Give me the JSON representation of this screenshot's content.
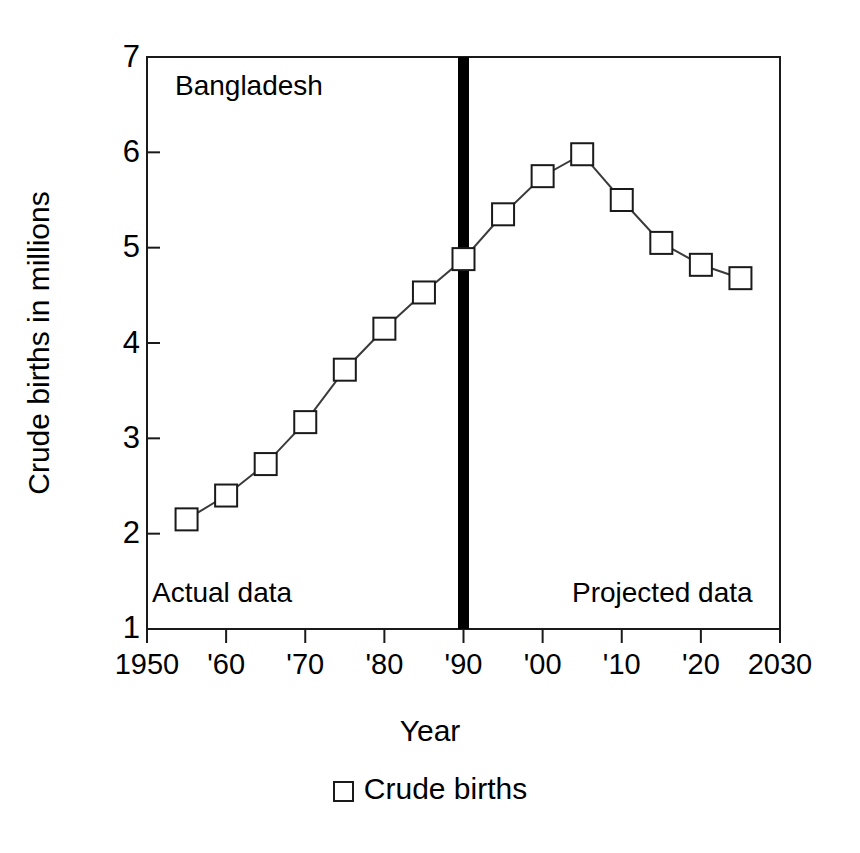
{
  "chart_data": {
    "type": "line",
    "title": "",
    "region_label": "Bangladesh",
    "xlabel": "Year",
    "ylabel": "Crude births in millions",
    "xlim": [
      1950,
      2030
    ],
    "ylim": [
      1,
      7
    ],
    "grid": false,
    "x": [
      1955,
      1960,
      1965,
      1970,
      1975,
      1980,
      1985,
      1990,
      1995,
      2000,
      2005,
      2010,
      2015,
      2020,
      2025
    ],
    "series": [
      {
        "name": "Crude births",
        "marker": "open-square",
        "values": [
          2.15,
          2.4,
          2.73,
          3.17,
          3.72,
          4.15,
          4.53,
          4.88,
          5.35,
          5.75,
          5.98,
          5.5,
          5.05,
          4.82,
          4.68
        ]
      }
    ],
    "y_ticks": [
      1,
      2,
      3,
      4,
      5,
      6,
      7
    ],
    "y_tick_labels": [
      "1",
      "2",
      "3",
      "4",
      "5",
      "6",
      "7"
    ],
    "x_ticks": [
      1950,
      1960,
      1970,
      1980,
      1990,
      2000,
      2010,
      2020,
      2030
    ],
    "x_tick_labels": [
      "1950",
      "'60",
      "'70",
      "'80",
      "'90",
      "'00",
      "'10",
      "'20",
      "2030"
    ],
    "annotations": [
      {
        "name": "actual-data",
        "text": "Actual data",
        "x": 1952,
        "y": 1.4
      },
      {
        "name": "projected-data",
        "text": "Projected data",
        "x": 2003,
        "y": 1.4
      },
      {
        "name": "region",
        "text": "Bangladesh",
        "x": 1953,
        "y": 6.8
      }
    ],
    "divider": {
      "name": "projection-divider",
      "x": 1990,
      "color": "#000000",
      "width_px": 11
    },
    "legend": {
      "position": "bottom-center",
      "entries": [
        "Crude births"
      ]
    },
    "colors": {
      "line": "#3a3a3a",
      "marker_edge": "#1a1a1a",
      "marker_fill": "#ffffff",
      "axis": "#000000",
      "divider": "#000000"
    }
  }
}
